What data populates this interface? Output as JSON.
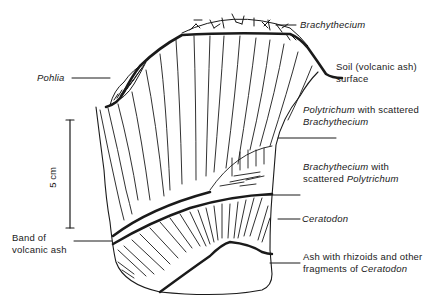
{
  "labels": {
    "brachythecium_top": "Brachythecium",
    "pohlia": "Pohlia",
    "soil_line1": "Soil (volcanic ash)",
    "soil_line2": "surface",
    "poly_italic": "Polytrichum",
    "poly_rest": " with scattered",
    "poly_line2": "Brachythecium",
    "brach_italic": "Brachythecium",
    "brach_rest": " with",
    "brach_line2_plain": "scattered ",
    "brach_line2_italic": "Polytrichum",
    "ceratodon": "Ceratodon",
    "ash_line1": "Ash with rhizoids and other",
    "ash_line2_plain": "fragments of ",
    "ash_line2_italic": "Ceratodon",
    "band_line1": "Band of",
    "band_line2": "volcanic ash",
    "scale": "5 cm"
  },
  "colors": {
    "ink": "#1a1a1a",
    "background": "#ffffff"
  }
}
